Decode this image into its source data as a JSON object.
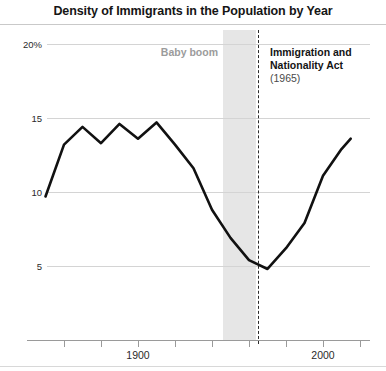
{
  "title": "Density of Immigrants in the Population by Year",
  "annotations": {
    "band_label": "Baby boom",
    "event_title_line1": "Immigration and",
    "event_title_line2": "Nationality Act",
    "event_year": "(1965)"
  },
  "chart_data": {
    "type": "line",
    "title": "Density of Immigrants in the Population by Year",
    "xlabel": "",
    "ylabel": "",
    "xlim": [
      1845,
      2020
    ],
    "ylim": [
      0,
      20
    ],
    "grid": true,
    "legend": "none",
    "y_ticks": [
      20,
      15,
      10,
      5
    ],
    "y_tick_labels": [
      "20%",
      "15",
      "10",
      "5"
    ],
    "x_ticks": [
      1860,
      1880,
      1900,
      1920,
      1940,
      1960,
      1980,
      2000,
      2020
    ],
    "x_tick_labels": [
      "",
      "",
      "1900",
      "",
      "",
      "",
      "",
      "2000",
      ""
    ],
    "series": [
      {
        "name": "Density of immigrants in the population",
        "x": [
          1850,
          1860,
          1870,
          1880,
          1890,
          1900,
          1910,
          1920,
          1930,
          1940,
          1950,
          1960,
          1970,
          1980,
          1990,
          2000,
          2010,
          2015
        ],
        "values": [
          9.7,
          13.2,
          14.4,
          13.3,
          14.6,
          13.6,
          14.7,
          13.2,
          11.6,
          8.8,
          6.9,
          5.4,
          4.8,
          6.2,
          7.9,
          11.1,
          12.9,
          13.6
        ]
      }
    ],
    "shaded_regions": [
      {
        "label": "Baby boom",
        "x_start": 1946,
        "x_end": 1964,
        "color": "#e6e6e6"
      }
    ],
    "event_markers": [
      {
        "label": "Immigration and Nationality Act",
        "year": 1965,
        "style": "dashed",
        "color": "#2b2b2b"
      }
    ]
  },
  "colors": {
    "line": "#111111",
    "grid": "#d4d4d4",
    "band": "#e6e6e6",
    "axis": "#9a9a9a",
    "band_label": "#9b9b9b"
  }
}
